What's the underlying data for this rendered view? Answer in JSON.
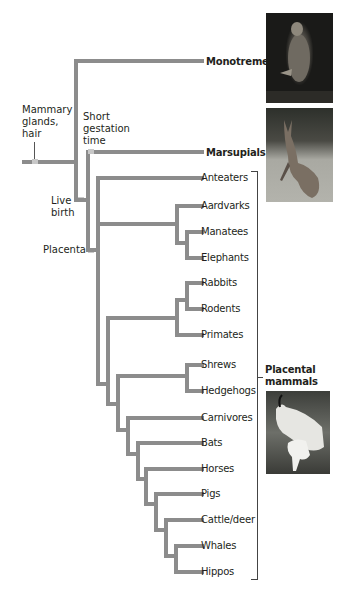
{
  "diagram": {
    "type": "phylogenetic-tree",
    "traits": {
      "mammary": "Mammary\nglands,\nhair",
      "mammary_lines": [
        "Mammary",
        "glands,",
        "hair"
      ],
      "short_gestation_lines": [
        "Short",
        "gestation",
        "time"
      ],
      "live_birth_lines": [
        "Live",
        "birth"
      ],
      "placenta": "Placenta"
    },
    "groups": {
      "monotremes": "Monotremes",
      "marsupials": "Marsupials",
      "placental_lines": [
        "Placental",
        "mammals"
      ]
    },
    "taxa": [
      "Anteaters",
      "Aardvarks",
      "Manatees",
      "Elephants",
      "Rabbits",
      "Rodents",
      "Primates",
      "Shrews",
      "Hedgehogs",
      "Carnivores",
      "Bats",
      "Horses",
      "Pigs",
      "Cattle/deer",
      "Whales",
      "Hippos"
    ],
    "photos": [
      "platypus-photo",
      "kangaroo-photo",
      "mountain-goat-photo"
    ],
    "colors": {
      "branch": "#8c8c8c",
      "marker": "#c8c8c8",
      "text": "#231f20"
    }
  }
}
